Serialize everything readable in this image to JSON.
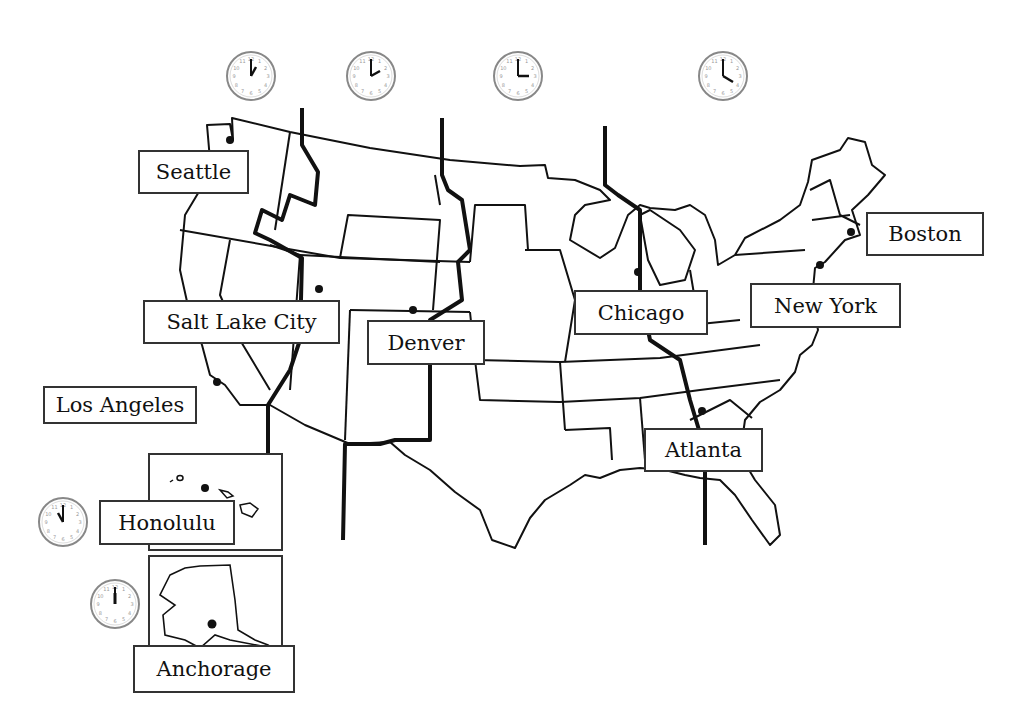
{
  "time_zones": [
    {
      "name": "Pacific",
      "clock": {
        "hour": 1,
        "minute": 0,
        "label": "1:00"
      }
    },
    {
      "name": "Mountain",
      "clock": {
        "hour": 2,
        "minute": 0,
        "label": "2:00"
      }
    },
    {
      "name": "Central",
      "clock": {
        "hour": 3,
        "minute": 0,
        "label": "3:00"
      }
    },
    {
      "name": "Eastern",
      "clock": {
        "hour": 4,
        "minute": 0,
        "label": "4:00"
      }
    },
    {
      "name": "Hawaii",
      "clock": {
        "hour": 11,
        "minute": 0,
        "label": "11:00"
      }
    },
    {
      "name": "Alaska",
      "clock": {
        "hour": 12,
        "minute": 0,
        "label": "12:00"
      }
    }
  ],
  "cities": {
    "seattle": "Seattle",
    "salt_lake_city": "Salt Lake City",
    "denver": "Denver",
    "los_angeles": "Los Angeles",
    "chicago": "Chicago",
    "new_york": "New York",
    "boston": "Boston",
    "atlanta": "Atlanta",
    "honolulu": "Honolulu",
    "anchorage": "Anchorage"
  },
  "colors": {
    "line": "#111111",
    "clock_rim": "#888888",
    "label_border": "#333333"
  }
}
